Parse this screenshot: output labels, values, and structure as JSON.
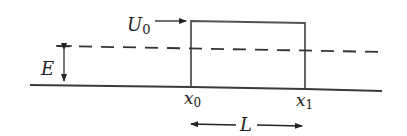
{
  "diagram": {
    "type": "potential-barrier",
    "labels": {
      "barrier_height": "U",
      "barrier_height_sub": "0",
      "energy": "E",
      "left_edge": "x",
      "left_edge_sub": "0",
      "right_edge": "x",
      "right_edge_sub": "1",
      "width": "L"
    },
    "colors": {
      "line": "#3a3a3a",
      "background": "#ffffff"
    }
  }
}
